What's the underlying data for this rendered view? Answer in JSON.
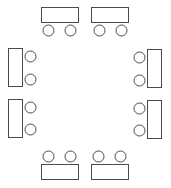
{
  "diagram": {
    "stroke_color": "#4a4a4a",
    "background": "#ffffff",
    "groups": [
      {
        "name": "top-left",
        "table": {
          "x": 41.5,
          "y": 7.5,
          "w": 37,
          "h": 15
        },
        "chairs": [
          {
            "cx": 48.5,
            "cy": 30.5
          },
          {
            "cx": 70.5,
            "cy": 30.5
          }
        ]
      },
      {
        "name": "top-right",
        "table": {
          "x": 91.5,
          "y": 7.5,
          "w": 37,
          "h": 15
        },
        "chairs": [
          {
            "cx": 99.5,
            "cy": 30.5
          },
          {
            "cx": 121.5,
            "cy": 30.5
          }
        ]
      },
      {
        "name": "left-upper",
        "table": {
          "x": 8.5,
          "y": 48.5,
          "w": 14,
          "h": 38
        },
        "chairs": [
          {
            "cx": 30.5,
            "cy": 56.5
          },
          {
            "cx": 30.5,
            "cy": 79.5
          }
        ]
      },
      {
        "name": "left-lower",
        "table": {
          "x": 8.5,
          "y": 99.5,
          "w": 14,
          "h": 38
        },
        "chairs": [
          {
            "cx": 30.5,
            "cy": 107.5
          },
          {
            "cx": 30.5,
            "cy": 129.5
          }
        ]
      },
      {
        "name": "right-upper",
        "table": {
          "x": 147.5,
          "y": 49.5,
          "w": 14,
          "h": 38
        },
        "chairs": [
          {
            "cx": 139.5,
            "cy": 57.5
          },
          {
            "cx": 139.5,
            "cy": 80.5
          }
        ]
      },
      {
        "name": "right-lower",
        "table": {
          "x": 147.5,
          "y": 100.5,
          "w": 14,
          "h": 38
        },
        "chairs": [
          {
            "cx": 139.5,
            "cy": 108.5
          },
          {
            "cx": 139.5,
            "cy": 130.5
          }
        ]
      },
      {
        "name": "bottom-left",
        "table": {
          "x": 41.5,
          "y": 164.5,
          "w": 37,
          "h": 15
        },
        "chairs": [
          {
            "cx": 48.5,
            "cy": 156.5
          },
          {
            "cx": 70.5,
            "cy": 156.5
          }
        ]
      },
      {
        "name": "bottom-right",
        "table": {
          "x": 91.5,
          "y": 164.5,
          "w": 37,
          "h": 15
        },
        "chairs": [
          {
            "cx": 98.5,
            "cy": 156.5
          },
          {
            "cx": 120.5,
            "cy": 156.5
          }
        ]
      }
    ],
    "chair_radius": 5.5
  }
}
